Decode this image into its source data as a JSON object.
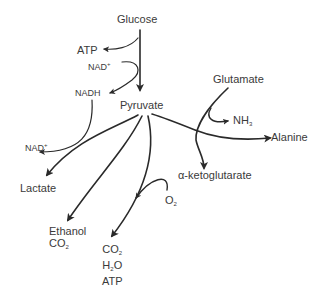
{
  "diagram": {
    "type": "metabolic-pathway",
    "nodes": {
      "glucose": "Glucose",
      "atp_top": "ATP",
      "nad_plus_top": "NAD",
      "nad_plus_top_sup": "+",
      "nadh": "NADH",
      "pyruvate": "Pyruvate",
      "nad_plus_left": "NAD",
      "nad_plus_left_sup": "+",
      "lactate": "Lactate",
      "ethanol": "Ethanol",
      "ethanol_co2": "CO",
      "ethanol_co2_sub": "2",
      "co2": "CO",
      "co2_sub": "2",
      "h2o_h": "H",
      "h2o_sub": "2",
      "h2o_o": "O",
      "atp_bottom": "ATP",
      "o2": "O",
      "o2_sub": "2",
      "glutamate": "Glutamate",
      "nh3": "NH",
      "nh3_sub": "3",
      "alanine": "Alanine",
      "alpha_ketoglutarate": "α-ketoglutarate"
    },
    "edges": [
      {
        "from": "Glucose",
        "to": "Pyruvate"
      },
      {
        "from": "Glucose pathway",
        "to": "ATP"
      },
      {
        "from": "NAD+",
        "to": "NADH"
      },
      {
        "from": "NADH",
        "to": "NAD+ (left)"
      },
      {
        "from": "Pyruvate",
        "to": "Lactate"
      },
      {
        "from": "Pyruvate",
        "to": "Ethanol + CO2"
      },
      {
        "from": "Pyruvate",
        "to": "CO2 + H2O + ATP"
      },
      {
        "from": "O2",
        "to": "CO2 + H2O + ATP pathway"
      },
      {
        "from": "Pyruvate",
        "to": "Alanine"
      },
      {
        "from": "Glutamate",
        "to": "α-ketoglutarate"
      },
      {
        "from": "Glutamate",
        "to": "NH3"
      }
    ],
    "colors": {
      "line": "#2a2a2a",
      "text": "#3a3a3a",
      "background": "#ffffff"
    }
  }
}
